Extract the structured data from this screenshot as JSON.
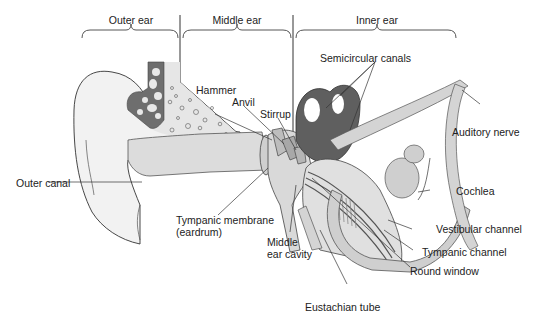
{
  "diagram": {
    "sections": [
      {
        "id": "outer",
        "label": "Outer ear"
      },
      {
        "id": "middle",
        "label": "Middle ear"
      },
      {
        "id": "inner",
        "label": "Inner ear"
      }
    ],
    "labels": {
      "hammer": "Hammer",
      "anvil": "Anvil",
      "stirrup": "Stirrup",
      "semicircular_canals": "Semicircular canals",
      "auditory_nerve": "Auditory nerve",
      "outer_canal": "Outer canal",
      "cochlea": "Cochlea",
      "tympanic_membrane_line1": "Tympanic membrane",
      "tympanic_membrane_line2": "(eardrum)",
      "middle_ear_cavity_line1": "Middle",
      "middle_ear_cavity_line2": "ear cavity",
      "vestibular_channel": "Vestibular channel",
      "tympanic_channel": "Tympanic channel",
      "round_window": "Round window",
      "eustachian_tube": "Eustachian tube"
    },
    "colors": {
      "line": "#333333",
      "light_tissue": "#e4e4e4",
      "mid_tissue": "#d2d2d2",
      "bone_dark": "#6e6e6e",
      "canal_dark": "#5f5f5f",
      "bone_speckle": "#ececec"
    }
  }
}
